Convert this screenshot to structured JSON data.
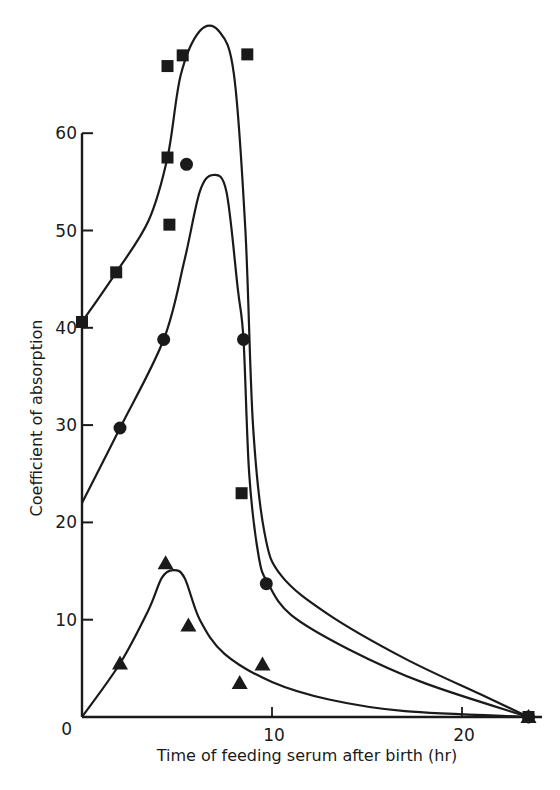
{
  "chart_data": {
    "type": "scatter",
    "title": "",
    "xlabel": "Time of feeding serum after birth (hr)",
    "ylabel": "Coefficient of absorption",
    "xlim": [
      0,
      24
    ],
    "ylim": [
      0,
      60
    ],
    "x_ticks": [
      0,
      10,
      20
    ],
    "y_ticks": [
      0,
      10,
      20,
      30,
      40,
      50,
      60
    ],
    "grid": false,
    "legend": "none",
    "series": [
      {
        "name": "squares",
        "marker": "square",
        "points": [
          [
            0,
            40.6
          ],
          [
            1.8,
            45.7
          ],
          [
            4.5,
            57.5
          ],
          [
            4.6,
            50.6
          ],
          [
            4.5,
            66.9
          ],
          [
            5.3,
            68.0
          ],
          [
            8.7,
            68.1
          ],
          [
            8.4,
            23.0
          ],
          [
            23.5,
            0
          ]
        ],
        "fitted_curve": [
          [
            0,
            40.6
          ],
          [
            1.8,
            45.7
          ],
          [
            3.5,
            51
          ],
          [
            4.5,
            57.5
          ],
          [
            5.2,
            66
          ],
          [
            6.2,
            70.5
          ],
          [
            7.2,
            70.5
          ],
          [
            8.0,
            66
          ],
          [
            8.6,
            50
          ],
          [
            9.0,
            30
          ],
          [
            9.6,
            19
          ],
          [
            10.5,
            14.5
          ],
          [
            13,
            10.5
          ],
          [
            17,
            6
          ],
          [
            21,
            2.3
          ],
          [
            23.5,
            0
          ]
        ]
      },
      {
        "name": "circles",
        "marker": "circle",
        "points": [
          [
            2.0,
            29.7
          ],
          [
            4.3,
            38.8
          ],
          [
            5.5,
            56.8
          ],
          [
            8.5,
            38.8
          ],
          [
            9.7,
            13.7
          ],
          [
            23.5,
            0
          ]
        ],
        "fitted_curve": [
          [
            0,
            22
          ],
          [
            2.0,
            29.7
          ],
          [
            4.3,
            38.8
          ],
          [
            5.4,
            47
          ],
          [
            6.2,
            54
          ],
          [
            6.9,
            55.7
          ],
          [
            7.6,
            54
          ],
          [
            8.2,
            44
          ],
          [
            8.5,
            38.8
          ],
          [
            8.8,
            25
          ],
          [
            9.3,
            16.5
          ],
          [
            9.8,
            13.7
          ],
          [
            11,
            10.5
          ],
          [
            14,
            7
          ],
          [
            18,
            3.5
          ],
          [
            23.5,
            0
          ]
        ]
      },
      {
        "name": "triangles",
        "marker": "triangle",
        "points": [
          [
            2.0,
            5.5
          ],
          [
            4.4,
            15.8
          ],
          [
            5.6,
            9.4
          ],
          [
            8.3,
            3.5
          ],
          [
            9.5,
            5.4
          ],
          [
            23.5,
            0
          ]
        ],
        "fitted_curve": [
          [
            0,
            0
          ],
          [
            2.0,
            5.5
          ],
          [
            3.5,
            11
          ],
          [
            4.2,
            14.3
          ],
          [
            4.8,
            15.1
          ],
          [
            5.4,
            14.3
          ],
          [
            6.2,
            10
          ],
          [
            7.5,
            6.5
          ],
          [
            10,
            3.6
          ],
          [
            13,
            1.8
          ],
          [
            17,
            0.6
          ],
          [
            23.5,
            0
          ]
        ]
      }
    ]
  }
}
